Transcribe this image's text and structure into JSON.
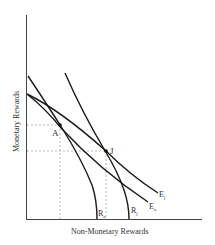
{
  "diagram": {
    "type": "economics-indifference-diagram",
    "axes": {
      "x_label": "Non-Monetary Rewards",
      "y_label": "Monetary Rewards"
    },
    "points": [
      {
        "label": "A",
        "x": 60,
        "y": 125
      },
      {
        "label": "J",
        "x": 106,
        "y": 151
      }
    ],
    "curves": [
      {
        "id": "R_a",
        "label": "R",
        "subscript": "a"
      },
      {
        "id": "R_j",
        "label": "R",
        "subscript": "j"
      },
      {
        "id": "E_a",
        "label": "E",
        "subscript": "a"
      },
      {
        "id": "E_j",
        "label": "E",
        "subscript": "j"
      }
    ]
  },
  "colors": {
    "curve": "#1a1a1a",
    "axis": "#333333",
    "dashed": "#888888",
    "text": "#333333"
  }
}
